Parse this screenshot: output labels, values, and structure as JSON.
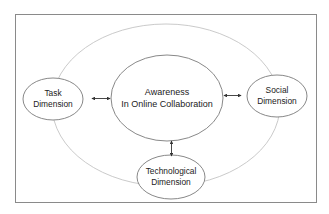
{
  "diagram": {
    "type": "conceptual-framework",
    "colors": {
      "frame": "#8a8a8a",
      "outer_ring": "#bdbdbd",
      "node_border": "#7a7a7a",
      "arrow": "#333333",
      "text": "#222222",
      "background": "#ffffff"
    },
    "center": {
      "line1": "Awareness",
      "line2": "In Online Collaboration"
    },
    "nodes": {
      "task": {
        "line1": "Task",
        "line2": "Dimension"
      },
      "social": {
        "line1": "Social",
        "line2": "Dimension"
      },
      "technological": {
        "line1": "Technological",
        "line2": "Dimension"
      }
    },
    "edges": [
      {
        "from": "task",
        "to": "center",
        "direction": "bidirectional"
      },
      {
        "from": "social",
        "to": "center",
        "direction": "bidirectional"
      },
      {
        "from": "technological",
        "to": "center",
        "direction": "bidirectional"
      }
    ]
  }
}
